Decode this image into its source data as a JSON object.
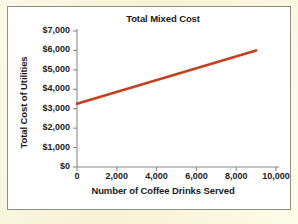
{
  "chart_data": {
    "type": "line",
    "title": "Total Mixed Cost",
    "xlabel": "Number of Coffee Drinks Served",
    "ylabel": "Total Cost of Utilities",
    "xlim": [
      0,
      10000
    ],
    "ylim": [
      0,
      7000
    ],
    "grid": false,
    "legend": null,
    "x_ticks": [
      0,
      2000,
      4000,
      6000,
      8000,
      10000
    ],
    "x_tick_labels": [
      "0",
      "2,000",
      "4,000",
      "6,000",
      "8,000",
      "10,000"
    ],
    "y_ticks": [
      0,
      1000,
      2000,
      3000,
      4000,
      5000,
      6000,
      7000
    ],
    "y_tick_labels": [
      "$0",
      "$1,000",
      "$2,000",
      "$3,000",
      "$4,000",
      "$5,000",
      "$6,000",
      "$7,000"
    ],
    "series": [
      {
        "name": "Total mixed cost",
        "color": "#C4401F",
        "x": [
          0,
          9000
        ],
        "values": [
          3250,
          6000
        ]
      }
    ]
  },
  "colors": {
    "line": "#C4401F",
    "axis": "#8a8a8a",
    "text": "#1b1b1b",
    "page_background": "#F8F5DD",
    "plot_background": "#FFFFFF",
    "frame_border": "#8F8F83"
  }
}
